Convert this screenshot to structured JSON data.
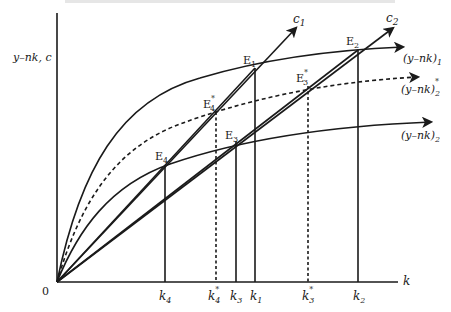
{
  "diagram": {
    "title_cropped": "",
    "y_axis_label": "y–nk, c",
    "x_axis_label": "k",
    "origin_label": "0",
    "curves": [
      {
        "name": "(y–nk)_1",
        "base": "(y–nk)",
        "sub": "1",
        "sup": "",
        "style": "solid"
      },
      {
        "name": "(y–nk)*_2",
        "base": "(y–nk)",
        "sub": "2",
        "sup": "*",
        "style": "dashed"
      },
      {
        "name": "(y–nk)_2",
        "base": "(y–nk)",
        "sub": "2",
        "sup": "",
        "style": "solid"
      }
    ],
    "rays": [
      {
        "name": "c_1",
        "base": "c",
        "sub": "1"
      },
      {
        "name": "c_2",
        "base": "c",
        "sub": "2"
      }
    ],
    "points": [
      {
        "id": "E1",
        "base": "E",
        "sub": "1",
        "sup": ""
      },
      {
        "id": "E2",
        "base": "E",
        "sub": "2",
        "sup": ""
      },
      {
        "id": "E3star",
        "base": "E",
        "sub": "3",
        "sup": "*"
      },
      {
        "id": "E4star",
        "base": "E",
        "sub": "4",
        "sup": "*"
      },
      {
        "id": "E3",
        "base": "E",
        "sub": "3",
        "sup": ""
      },
      {
        "id": "E4",
        "base": "E",
        "sub": "4",
        "sup": ""
      }
    ],
    "x_ticks": [
      {
        "id": "k4",
        "base": "k",
        "sub": "4",
        "sup": "",
        "style": "solid"
      },
      {
        "id": "k4star",
        "base": "k",
        "sub": "4",
        "sup": "*",
        "style": "dashed"
      },
      {
        "id": "k3",
        "base": "k",
        "sub": "3",
        "sup": "",
        "style": "solid"
      },
      {
        "id": "k1",
        "base": "k",
        "sub": "1",
        "sup": "",
        "style": "solid"
      },
      {
        "id": "k3star",
        "base": "k",
        "sub": "3",
        "sup": "*",
        "style": "dashed"
      },
      {
        "id": "k2",
        "base": "k",
        "sub": "2",
        "sup": "",
        "style": "solid"
      }
    ]
  }
}
